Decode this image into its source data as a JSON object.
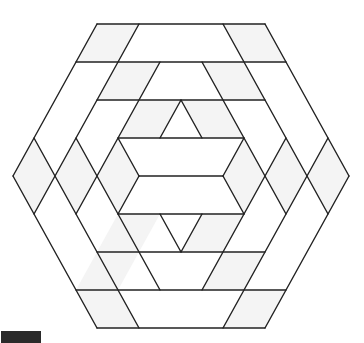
{
  "figure": {
    "lattice": {
      "origin_x": 181,
      "origin_y": 24,
      "unit_x": 21,
      "unit_y": 38
    },
    "stroke_color": "#222222",
    "stroke_width": 1.4,
    "shade_color": "#f4f4f4",
    "outline": [
      [
        -4,
        0
      ],
      [
        4,
        0
      ],
      [
        8,
        4
      ],
      [
        4,
        8
      ],
      [
        -4,
        8
      ],
      [
        -8,
        4
      ]
    ],
    "shaded_cells": [
      [
        [
          -4,
          0
        ],
        [
          -2,
          0
        ],
        [
          -3,
          1
        ],
        [
          -5,
          1
        ]
      ],
      [
        [
          2,
          0
        ],
        [
          4,
          0
        ],
        [
          5,
          1
        ],
        [
          3,
          1
        ]
      ],
      [
        [
          -3,
          1
        ],
        [
          -1,
          1
        ],
        [
          -2,
          2
        ],
        [
          -4,
          2
        ]
      ],
      [
        [
          1,
          1
        ],
        [
          3,
          1
        ],
        [
          4,
          2
        ],
        [
          2,
          2
        ]
      ],
      [
        [
          -2,
          2
        ],
        [
          0,
          2
        ],
        [
          -1,
          3
        ],
        [
          -3,
          3
        ]
      ],
      [
        [
          0,
          2
        ],
        [
          2,
          2
        ],
        [
          3,
          3
        ],
        [
          1,
          3
        ]
      ],
      [
        [
          -7,
          3
        ],
        [
          -6,
          4
        ],
        [
          -7,
          5
        ],
        [
          -8,
          4
        ]
      ],
      [
        [
          -5,
          3
        ],
        [
          -4,
          4
        ],
        [
          -5,
          5
        ],
        [
          -6,
          4
        ]
      ],
      [
        [
          -3,
          3
        ],
        [
          -2,
          4
        ],
        [
          -3,
          5
        ],
        [
          -4,
          4
        ]
      ],
      [
        [
          7,
          3
        ],
        [
          8,
          4
        ],
        [
          7,
          5
        ],
        [
          6,
          4
        ]
      ],
      [
        [
          5,
          3
        ],
        [
          6,
          4
        ],
        [
          5,
          5
        ],
        [
          4,
          4
        ]
      ],
      [
        [
          3,
          3
        ],
        [
          4,
          4
        ],
        [
          3,
          5
        ],
        [
          2,
          4
        ]
      ],
      [
        [
          -3,
          5
        ],
        [
          -1,
          5
        ],
        [
          -2,
          6
        ],
        [
          -4,
          6
        ]
      ],
      [
        [
          1,
          5
        ],
        [
          3,
          5
        ],
        [
          2,
          6
        ],
        [
          0,
          6
        ]
      ],
      [
        [
          -4,
          6
        ],
        [
          -2,
          6
        ],
        [
          -3,
          7
        ],
        [
          -5,
          7
        ]
      ],
      [
        [
          2,
          6
        ],
        [
          4,
          6
        ],
        [
          3,
          7
        ],
        [
          1,
          7
        ]
      ],
      [
        [
          -5,
          7
        ],
        [
          -3,
          7
        ],
        [
          -2,
          8
        ],
        [
          -4,
          8
        ]
      ],
      [
        [
          3,
          7
        ],
        [
          5,
          7
        ],
        [
          4,
          8
        ],
        [
          2,
          8
        ]
      ]
    ],
    "segments": [
      [
        [
          -4,
          0
        ],
        [
          4,
          0
        ]
      ],
      [
        [
          -5,
          1
        ],
        [
          5,
          1
        ]
      ],
      [
        [
          -4,
          2
        ],
        [
          4,
          2
        ]
      ],
      [
        [
          -3,
          3
        ],
        [
          3,
          3
        ]
      ],
      [
        [
          -2,
          4
        ],
        [
          2,
          4
        ]
      ],
      [
        [
          -3,
          5
        ],
        [
          3,
          5
        ]
      ],
      [
        [
          -4,
          6
        ],
        [
          4,
          6
        ]
      ],
      [
        [
          -5,
          7
        ],
        [
          5,
          7
        ]
      ],
      [
        [
          -4,
          8
        ],
        [
          4,
          8
        ]
      ],
      [
        [
          -4,
          0
        ],
        [
          -8,
          4
        ]
      ],
      [
        [
          -8,
          4
        ],
        [
          -4,
          8
        ]
      ],
      [
        [
          4,
          0
        ],
        [
          8,
          4
        ]
      ],
      [
        [
          8,
          4
        ],
        [
          4,
          8
        ]
      ],
      [
        [
          -2,
          0
        ],
        [
          -7,
          5
        ]
      ],
      [
        [
          -7,
          3
        ],
        [
          -2,
          8
        ]
      ],
      [
        [
          2,
          0
        ],
        [
          7,
          5
        ]
      ],
      [
        [
          7,
          3
        ],
        [
          2,
          8
        ]
      ],
      [
        [
          -1,
          1
        ],
        [
          -5,
          5
        ]
      ],
      [
        [
          -5,
          3
        ],
        [
          -1,
          7
        ]
      ],
      [
        [
          1,
          1
        ],
        [
          5,
          5
        ]
      ],
      [
        [
          5,
          3
        ],
        [
          1,
          7
        ]
      ],
      [
        [
          -3,
          3
        ],
        [
          -2,
          4
        ]
      ],
      [
        [
          -2,
          4
        ],
        [
          -3,
          5
        ]
      ],
      [
        [
          3,
          3
        ],
        [
          2,
          4
        ]
      ],
      [
        [
          2,
          4
        ],
        [
          3,
          5
        ]
      ],
      [
        [
          0,
          2
        ],
        [
          -1,
          3
        ]
      ],
      [
        [
          0,
          2
        ],
        [
          1,
          3
        ]
      ],
      [
        [
          -1,
          5
        ],
        [
          0,
          6
        ]
      ],
      [
        [
          1,
          5
        ],
        [
          0,
          6
        ]
      ]
    ]
  },
  "corner_box": {
    "color": "#2a2a2a"
  }
}
